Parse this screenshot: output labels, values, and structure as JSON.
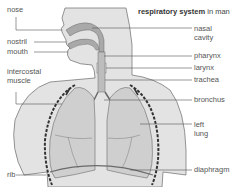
{
  "title": {
    "bold": "respiratory system",
    "rest": " in man"
  },
  "labels": {
    "left": {
      "nose": "nose",
      "nostril": "nostril",
      "mouth": "mouth",
      "intercostal_1": "intercostal",
      "intercostal_2": "muscle",
      "rib": "rib"
    },
    "right": {
      "nasal_1": "nasal",
      "nasal_2": "cavity",
      "pharynx": "pharynx",
      "larynx": "larynx",
      "trachea": "trachea",
      "bronchus": "bronchus",
      "lung_1": "left",
      "lung_2": "lung",
      "diaphragm": "diaphragm"
    }
  },
  "colors": {
    "body": "#e3e3e3",
    "outline": "#6a6a6a",
    "nasal": "#a9a9a9",
    "lung": "#cfcfcf",
    "rib": "#333333",
    "leader": "#555555"
  }
}
